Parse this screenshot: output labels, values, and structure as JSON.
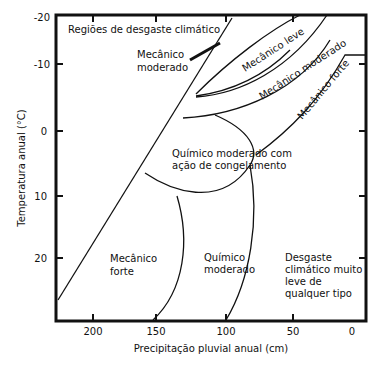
{
  "diagram": {
    "title": "Regiões de desgaste climático",
    "y_axis": {
      "label": "Temperatura anual (°C)",
      "ticks": [
        "-20",
        "-10",
        "0",
        "10",
        "20"
      ]
    },
    "x_axis": {
      "label": "Precipitação pluvial anual (cm)",
      "ticks": [
        "200",
        "150",
        "100",
        "50",
        "0"
      ]
    },
    "regions": {
      "mecanico_moderado": [
        "Mecânico",
        "moderado"
      ],
      "mecanico_leve": "Mecânico leve",
      "mecanico_moderado_band": "Mecânico moderado",
      "mecanico_forte_band": "Mecânico forte",
      "quimico_congelamento": [
        "Químico moderado com",
        "ação de congelamento"
      ],
      "mecanico_forte": [
        "Mecânico",
        "forte"
      ],
      "quimico_moderado": [
        "Químico",
        "moderado"
      ],
      "muito_leve": [
        "Desgaste",
        "climático muito",
        "leve de",
        "qualquer tipo"
      ]
    }
  }
}
